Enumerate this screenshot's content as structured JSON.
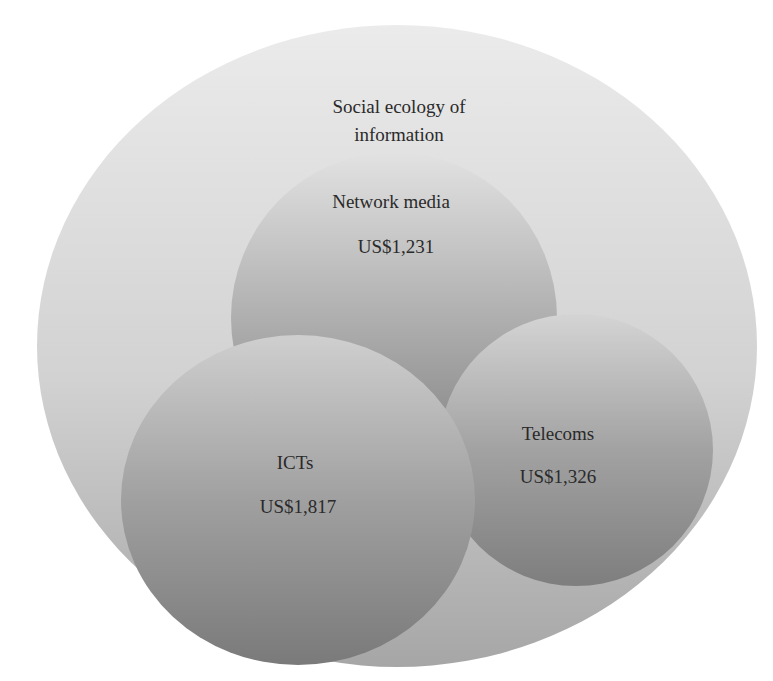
{
  "diagram": {
    "type": "nested-venn",
    "outer": {
      "label_line1": "Social ecology of",
      "label_line2": "information"
    },
    "circles": [
      {
        "id": "network-media",
        "label": "Network media",
        "value": "US$1,231"
      },
      {
        "id": "icts",
        "label": "ICTs",
        "value": "US$1,817"
      },
      {
        "id": "telecoms",
        "label": "Telecoms",
        "value": "US$1,326"
      }
    ],
    "colors": {
      "outer_top": "#e8e8e8",
      "outer_bottom": "#a9a9a9",
      "inner_top": "#dcdcdc",
      "inner_bottom": "#777777",
      "text": "#2a2a2a"
    }
  }
}
